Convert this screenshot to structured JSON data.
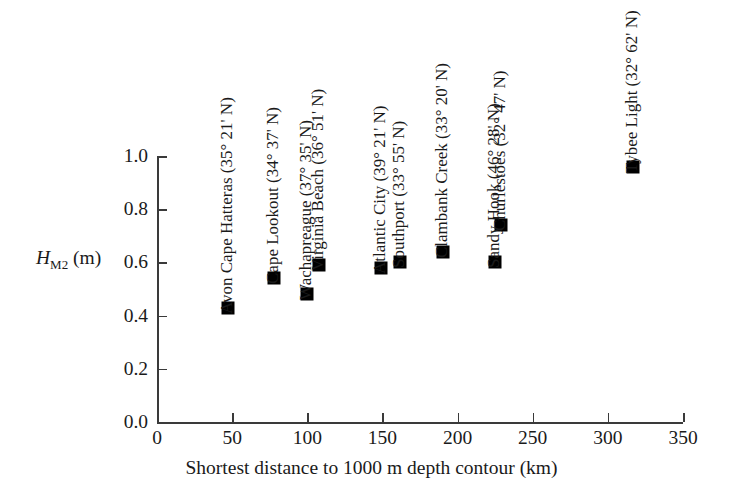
{
  "chart_data": {
    "type": "scatter",
    "title": "",
    "xlabel": "Shortest distance to 1000 m depth contour (km)",
    "ylabel": "H_M2 (m)",
    "ylabel_parts": {
      "symbol": "H",
      "subscript": "M2",
      "units": "(m)"
    },
    "xlim": [
      0,
      350
    ],
    "ylim": [
      0.0,
      1.0
    ],
    "xticks": [
      "0",
      "50",
      "100",
      "150",
      "200",
      "250",
      "300",
      "350"
    ],
    "xtick_values": [
      0,
      50,
      100,
      150,
      200,
      250,
      300,
      350
    ],
    "yticks": [
      "0.0",
      "0.2",
      "0.4",
      "0.6",
      "0.8",
      "1.0"
    ],
    "ytick_values": [
      0.0,
      0.2,
      0.4,
      0.6,
      0.8,
      1.0
    ],
    "grid": false,
    "legend": "none",
    "marker_style": "filled-square",
    "marker_color": "#000000",
    "points": [
      {
        "label": "Avon Cape Hatteras (35° 21' N)",
        "x": 47,
        "y": 0.43
      },
      {
        "label": "Cape Lookout (34° 37' N)",
        "x": 78,
        "y": 0.54
      },
      {
        "label": "Virginia Beach (36° 51' N)",
        "x": 108,
        "y": 0.59
      },
      {
        "label": "Wachapreague (37° 35' N)",
        "x": 100,
        "y": 0.48
      },
      {
        "label": "Atlantic City (39° 21' N)",
        "x": 149,
        "y": 0.58
      },
      {
        "label": "Southport (33° 55' N)",
        "x": 162,
        "y": 0.6
      },
      {
        "label": "Clambank Creek (33° 20' N)",
        "x": 190,
        "y": 0.64
      },
      {
        "label": "Sandy Hook (46° 28' N)",
        "x": 225,
        "y": 0.6
      },
      {
        "label": "Churlestoes (32° 47' N)",
        "x": 229,
        "y": 0.74
      },
      {
        "label": "Tybee Light (32° 62' N)",
        "x": 317,
        "y": 0.96
      }
    ]
  },
  "axis": {
    "x_title": "Shortest distance to 1000 m depth contour (km)",
    "y_symbol": "H",
    "y_subscript": "M2",
    "y_units": "(m)"
  }
}
